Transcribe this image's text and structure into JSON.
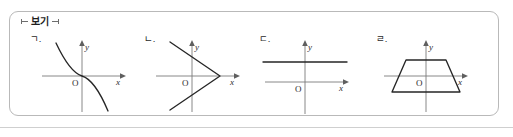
{
  "box": {
    "title": "보기",
    "border_color": "#b9b9b9"
  },
  "figures": [
    {
      "label": "ㄱ.",
      "graph_type": "decreasing-cubic",
      "x_axis_label": "x",
      "y_axis_label": "y",
      "origin_label": "O",
      "description": "Decreasing cubic curve passing through the origin, falling from upper-left to lower-right"
    },
    {
      "label": "ㄴ.",
      "graph_type": "sideways-v",
      "x_axis_label": "x",
      "y_axis_label": "y",
      "origin_label": "O",
      "description": "Sideways V shape with vertex on the positive x-axis, opening to the left"
    },
    {
      "label": "ㄷ.",
      "graph_type": "horizontal-line",
      "x_axis_label": "x",
      "y_axis_label": "y",
      "origin_label": "O",
      "description": "Horizontal line segment above and parallel to the x-axis"
    },
    {
      "label": "ㄹ.",
      "graph_type": "trapezoid",
      "x_axis_label": "x",
      "y_axis_label": "y",
      "origin_label": "O",
      "description": "Isosceles trapezoid symmetric about the y-axis, straddling the x-axis"
    }
  ],
  "colors": {
    "curve": "#262626",
    "axis": "#7c7c7c",
    "text": "#2c2c2c",
    "rule": "#cfcfcf"
  }
}
